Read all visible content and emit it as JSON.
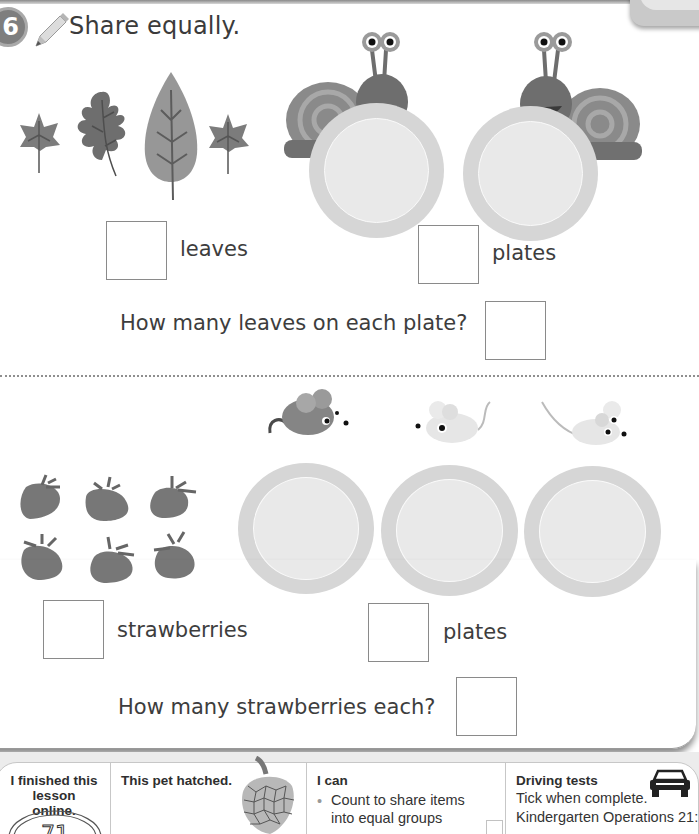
{
  "question": {
    "number": "6",
    "title": "Share equally."
  },
  "section_leaves": {
    "items_icon": "leaf-icon",
    "item_count_shown": 4,
    "plates_shown": 2,
    "characters": "snail",
    "items_label": "leaves",
    "plates_label": "plates",
    "question": "How many leaves on each plate?",
    "answers": {
      "items": "",
      "plates": "",
      "each": ""
    }
  },
  "section_strawberries": {
    "items_icon": "strawberry-icon",
    "item_count_shown": 6,
    "plates_shown": 3,
    "characters": "mouse",
    "items_label": "strawberries",
    "plates_label": "plates",
    "question": "How many strawberries each?",
    "answers": {
      "items": "",
      "plates": "",
      "each": ""
    }
  },
  "footer": {
    "online": {
      "heading": "I finished this lesson online.",
      "line1": "I finished this",
      "line2": "lesson online.",
      "stamp": "71"
    },
    "pet": {
      "heading": "This pet hatched."
    },
    "i_can": {
      "heading": "I can",
      "bullets": [
        {
          "line1": "Count to share items",
          "line2": "into equal groups"
        }
      ]
    },
    "driving": {
      "heading": "Driving tests",
      "line1": "Tick when complete.",
      "line2": "Kindergarten Operations 21:"
    }
  },
  "colors": {
    "plate_rim": "#d6d6d6",
    "plate_center": "#e9e9e9",
    "text": "#3b3b3b",
    "box_border": "#8a8a8a"
  }
}
